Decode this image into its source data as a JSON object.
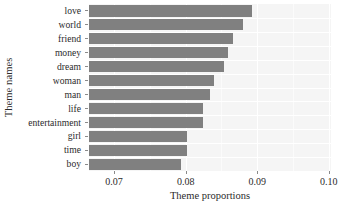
{
  "chart_data": {
    "type": "bar",
    "orientation": "horizontal",
    "title": "",
    "xlabel": "Theme proportions",
    "ylabel": "Theme names",
    "categories": [
      "love",
      "world",
      "friend",
      "money",
      "dream",
      "woman",
      "man",
      "life",
      "entertainment",
      "girl",
      "time",
      "boy"
    ],
    "values": [
      0.0892,
      0.088,
      0.0866,
      0.0859,
      0.0853,
      0.084,
      0.0834,
      0.0824,
      0.0824,
      0.0802,
      0.0802,
      0.0793
    ],
    "xlim": [
      0.0665,
      0.1003
    ],
    "xticks": [
      0.07,
      0.08,
      0.09,
      0.1
    ],
    "xtick_labels": [
      "0.07",
      "0.08",
      "0.09",
      "0.10"
    ],
    "xticks_minor": [
      0.075,
      0.085,
      0.095
    ],
    "grid": true,
    "legend": false,
    "bar_color": "#808080",
    "panel_color": "#f5f5f5",
    "gridline_color": "#ffffff",
    "text_color": "#2b2b2b"
  }
}
